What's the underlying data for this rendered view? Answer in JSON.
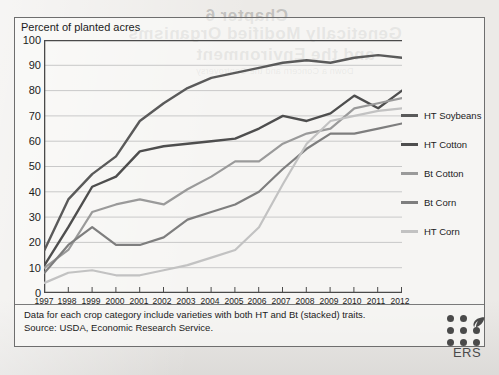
{
  "chart_data": {
    "type": "line",
    "title": "",
    "ylabel": "Percent of planted acres",
    "xlabel": "",
    "ylim": [
      0,
      100
    ],
    "ytick_step": 10,
    "yticks": [
      0,
      10,
      20,
      30,
      40,
      50,
      60,
      70,
      80,
      90,
      100
    ],
    "grid": true,
    "legend_position": "right",
    "categories": [
      1997,
      1998,
      1999,
      2000,
      2001,
      2002,
      2003,
      2004,
      2005,
      2006,
      2007,
      2008,
      2009,
      2010,
      2011,
      2012
    ],
    "x": [
      "1997",
      "1998",
      "1999",
      "2000",
      "2001",
      "2002",
      "2003",
      "2004",
      "2005",
      "2006",
      "2007",
      "2008",
      "2009",
      "2010",
      "2011",
      "2012"
    ],
    "series": [
      {
        "name": "HT Soybeans",
        "color": "#5a5a5a",
        "values": [
          17,
          37,
          47,
          54,
          68,
          75,
          81,
          85,
          87,
          89,
          91,
          92,
          91,
          93,
          94,
          93
        ]
      },
      {
        "name": "HT Cotton",
        "color": "#4e4e4e",
        "values": [
          11,
          26,
          42,
          46,
          56,
          58,
          59,
          60,
          61,
          65,
          70,
          68,
          71,
          78,
          73,
          80
        ]
      },
      {
        "name": "Bt Cotton",
        "color": "#9a9a9a",
        "values": [
          10,
          17,
          32,
          35,
          37,
          35,
          41,
          46,
          52,
          52,
          59,
          63,
          65,
          73,
          75,
          77
        ]
      },
      {
        "name": "Bt Corn",
        "color": "#7e7e7e",
        "values": [
          8,
          19,
          26,
          19,
          19,
          22,
          29,
          32,
          35,
          40,
          49,
          57,
          63,
          63,
          65,
          67
        ]
      },
      {
        "name": "HT Corn",
        "color": "#c2c2c2",
        "values": [
          4,
          8,
          9,
          7,
          7,
          9,
          11,
          14,
          17,
          26,
          43,
          59,
          68,
          70,
          72,
          73
        ]
      }
    ],
    "notes": [
      "Data for each crop category include varieties with both HT and Bt (stacked) traits.",
      "Source: USDA, Economic Research Service."
    ]
  },
  "logo": {
    "text": "ERS",
    "leaf_icon": "leaf-icon"
  },
  "bleedthrough": {
    "line1": "Chapter 6",
    "line2": "Genetically Modified Organisms",
    "line3": "and the Environment",
    "line4": "Down a Concern and the Controversy"
  }
}
